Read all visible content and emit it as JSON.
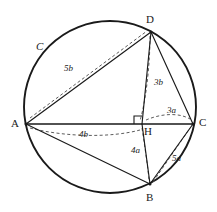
{
  "figure": {
    "background_color": "#ffffff",
    "stroke_color": "#1a1a1a",
    "width": 217,
    "height": 212
  },
  "circle": {
    "name": "C",
    "center": {
      "x": 110,
      "y": 107
    },
    "radius": 86,
    "stroke_width": 1.8
  },
  "vertices": [
    {
      "id": "D",
      "label": "D",
      "x": 151,
      "y": 32,
      "label_x": 146,
      "label_y": 14
    },
    {
      "id": "A",
      "label": "A",
      "x": 26,
      "y": 124,
      "label_x": 11,
      "label_y": 119
    },
    {
      "id": "C",
      "label": "C",
      "x": 193,
      "y": 124,
      "label_x": 199,
      "label_y": 118
    },
    {
      "id": "B",
      "label": "B",
      "x": 150,
      "y": 184,
      "label_x": 146,
      "label_y": 193
    },
    {
      "id": "H",
      "label": "H",
      "x": 142,
      "y": 124,
      "label_x": 144,
      "label_y": 126
    }
  ],
  "solid_segments": [
    {
      "name": "segment-AD",
      "from": "A",
      "to": "D"
    },
    {
      "name": "segment-DC",
      "from": "D",
      "to": "C"
    },
    {
      "name": "segment-AC",
      "from": "A",
      "to": "C"
    },
    {
      "name": "segment-AB",
      "from": "A",
      "to": "B"
    },
    {
      "name": "segment-BC",
      "from": "B",
      "to": "C"
    },
    {
      "name": "segment-DH",
      "from": "D",
      "to": "H"
    },
    {
      "name": "segment-HB",
      "from": "H",
      "to": "B"
    }
  ],
  "dashed_segments": [
    {
      "name": "dashed-measure-AD",
      "label": "5b"
    },
    {
      "name": "dashed-measure-DH",
      "label": "3b"
    },
    {
      "name": "dashed-measure-AH",
      "label": "4b"
    },
    {
      "name": "dashed-measure-HC",
      "label": "3a"
    },
    {
      "name": "dashed-measure-HB",
      "label": "4a"
    },
    {
      "name": "dashed-measure-BC",
      "label": "5a"
    }
  ],
  "segment_labels": [
    {
      "name": "label-5b",
      "text": "5b",
      "x": 64,
      "y": 64,
      "for": "AD"
    },
    {
      "name": "label-3b",
      "text": "3b",
      "x": 154,
      "y": 78,
      "for": "DH"
    },
    {
      "name": "label-4b",
      "text": "4b",
      "x": 79,
      "y": 130,
      "for": "AH"
    },
    {
      "name": "label-3a",
      "text": "3a",
      "x": 167,
      "y": 107,
      "for": "HC"
    },
    {
      "name": "label-4a",
      "text": "4a",
      "x": 131,
      "y": 146,
      "for": "HB"
    },
    {
      "name": "label-5a",
      "text": "5a",
      "x": 172,
      "y": 155,
      "for": "BC"
    }
  ],
  "circle_name_label": {
    "name": "label-circle-C",
    "text": "C",
    "x": 36,
    "y": 42
  },
  "right_angle": {
    "name": "right-angle-marker-at-H",
    "vertex_x": 142,
    "vertex_y": 124,
    "size": 8,
    "description": "right angle between DH and AC at H"
  }
}
